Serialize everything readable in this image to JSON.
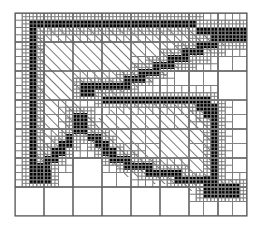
{
  "figure": {
    "colors": {
      "boundary_cell": "#000000",
      "interior_hatch": "#000000",
      "background": "#ffffff",
      "grid_line": "#808080",
      "coarse_grid_line": "#606060"
    },
    "grid": {
      "origin_x": 15,
      "origin_y": 13,
      "coarse_cell_size": 29,
      "coarse_cols": 8,
      "coarse_rows": 7,
      "max_refinement_levels": 3,
      "hatch_angle_deg": 45,
      "hatch_spacing_px": 7
    },
    "legend_note": "",
    "cells": {
      "boundary": [
        [
          15,
          20,
          2
        ],
        [
          17,
          20,
          2
        ],
        [
          19,
          20,
          2
        ],
        [
          21,
          20,
          2
        ],
        [
          23,
          20,
          2
        ],
        [
          25,
          20,
          2
        ],
        [
          27,
          20,
          2
        ],
        [
          29,
          20,
          2
        ],
        [
          31,
          20,
          2
        ],
        [
          33,
          20,
          2
        ],
        [
          35,
          20,
          2
        ],
        [
          37,
          20,
          2
        ],
        [
          39,
          20,
          2
        ],
        [
          41,
          20,
          2
        ],
        [
          43,
          20,
          2
        ],
        [
          45,
          20,
          2
        ],
        [
          47,
          20,
          2
        ],
        [
          49,
          20,
          2
        ],
        [
          51,
          20,
          2
        ],
        [
          53,
          20,
          2
        ],
        [
          55,
          20,
          2
        ],
        [
          57,
          20,
          2
        ],
        [
          59,
          20,
          2
        ],
        [
          61,
          20,
          2
        ],
        [
          63,
          20,
          2
        ],
        [
          65,
          20,
          2
        ],
        [
          67,
          20,
          2
        ],
        [
          69,
          20,
          2
        ],
        [
          71,
          20,
          2
        ],
        [
          73,
          20,
          2
        ]
      ],
      "interior_hatched": [],
      "exterior": []
    }
  },
  "labels": {
    "none": ""
  }
}
